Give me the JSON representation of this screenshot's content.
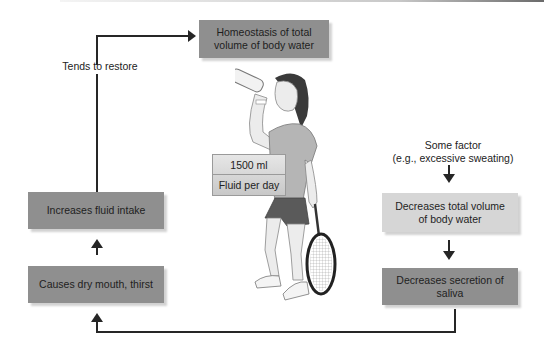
{
  "diagram": {
    "title_box": "Homeostasis of total volume of body water",
    "feedback_label": "Tends to restore",
    "left_column": [
      {
        "label": "Increases fluid intake"
      },
      {
        "label": "Causes dry mouth, thirst"
      }
    ],
    "right_column": {
      "stimulus": "Some factor\n(e.g., excessive sweating)",
      "boxes": [
        {
          "label": "Decreases total volume of body water"
        },
        {
          "label": "Decreases secretion of saliva"
        }
      ]
    },
    "intake_badge": {
      "amount": "1500 ml",
      "caption": "Fluid per day"
    },
    "illustration": "woman-drinking-from-bottle-holding-tennis-racket",
    "colors": {
      "dark_box": "#8f8f8f",
      "light_box": "#d6d6d6",
      "arrow": "#262626"
    }
  }
}
